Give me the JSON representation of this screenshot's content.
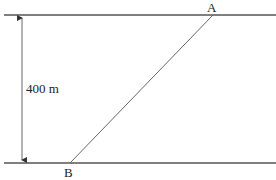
{
  "diagram": {
    "type": "river-crossing",
    "banks": {
      "top": {
        "y": 15,
        "x1": 4,
        "x2": 276
      },
      "bottom": {
        "y": 163,
        "x1": 4,
        "x2": 276
      }
    },
    "width_marker": {
      "x": 22,
      "y1": 15,
      "y2": 163,
      "label": "400 m"
    },
    "points": {
      "A": {
        "label": "A",
        "x": 213,
        "y": 15
      },
      "B": {
        "label": "B",
        "x": 70,
        "y": 163
      }
    },
    "colors": {
      "line": "#555555",
      "text": "#222222",
      "background": "#ffffff"
    }
  }
}
